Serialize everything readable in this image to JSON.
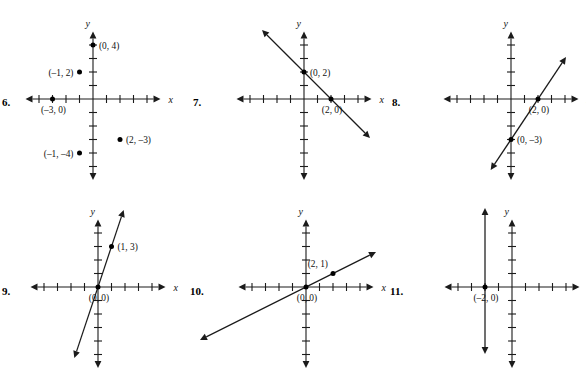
{
  "page": {
    "background": "#ffffff",
    "ink": "#1b1b1b",
    "width": 586,
    "height": 370
  },
  "axis_names": {
    "x": "x",
    "y": "y"
  },
  "chart_data": [
    {
      "id": "problem-6",
      "type": "scatter",
      "number_label": "6.",
      "title": "",
      "xlabel": "x",
      "ylabel": "y",
      "grid": false,
      "legend": "none",
      "xlim": [
        -5,
        5
      ],
      "ylim": [
        -6,
        5
      ],
      "xticks": [
        -4,
        -3,
        -2,
        -1,
        1,
        2,
        3,
        4
      ],
      "yticks": [
        -5,
        -4,
        -3,
        -2,
        -1,
        1,
        2,
        3,
        4
      ],
      "points": [
        {
          "x": 0,
          "y": 4,
          "label": "(0, 4)",
          "label_side": "right"
        },
        {
          "x": -1,
          "y": 2,
          "label": "(-1, 2)",
          "label_side": "left"
        },
        {
          "x": -3,
          "y": 0,
          "label": "(-3, 0)",
          "label_side": "below"
        },
        {
          "x": 2,
          "y": -3,
          "label": "(2, -3)",
          "label_side": "right"
        },
        {
          "x": -1,
          "y": -4,
          "label": "(-1, -4)",
          "label_side": "left"
        }
      ],
      "lines": []
    },
    {
      "id": "problem-7",
      "type": "line",
      "number_label": "7.",
      "title": "",
      "xlabel": "x",
      "ylabel": "y",
      "grid": false,
      "legend": "none",
      "xlim": [
        -5,
        5
      ],
      "ylim": [
        -6,
        5
      ],
      "xticks": [
        -4,
        -3,
        -2,
        -1,
        1,
        2,
        3,
        4
      ],
      "yticks": [
        -5,
        -4,
        -3,
        -2,
        -1,
        1,
        2,
        3,
        4
      ],
      "points": [
        {
          "x": 0,
          "y": 2,
          "label": "(0, 2)",
          "label_side": "right"
        },
        {
          "x": 2,
          "y": 0,
          "label": "(2, 0)",
          "label_side": "below"
        }
      ],
      "lines": [
        {
          "through": [
            [
              0,
              2
            ],
            [
              2,
              0
            ]
          ],
          "slope": -1,
          "intercept": 2,
          "arrows": "both"
        }
      ]
    },
    {
      "id": "problem-8",
      "type": "line",
      "number_label": "8.",
      "title": "",
      "xlabel": "x",
      "ylabel": "y",
      "grid": false,
      "legend": "none",
      "xlim": [
        -5,
        5
      ],
      "ylim": [
        -6,
        5
      ],
      "xticks": [
        -4,
        -3,
        -2,
        -1,
        1,
        2,
        3,
        4
      ],
      "yticks": [
        -5,
        -4,
        -3,
        -2,
        -1,
        1,
        2,
        3,
        4
      ],
      "points": [
        {
          "x": 2,
          "y": 0,
          "label": "(2, 0)",
          "label_side": "below"
        },
        {
          "x": 0,
          "y": -3,
          "label": "(0, -3)",
          "label_side": "right"
        }
      ],
      "lines": [
        {
          "through": [
            [
              0,
              -3
            ],
            [
              2,
              0
            ]
          ],
          "slope": 1.5,
          "intercept": -3,
          "arrows": "both"
        }
      ]
    },
    {
      "id": "problem-9",
      "type": "line",
      "number_label": "9.",
      "title": "",
      "xlabel": "x",
      "ylabel": "y",
      "grid": false,
      "legend": "none",
      "xlim": [
        -5,
        5
      ],
      "ylim": [
        -6,
        5
      ],
      "xticks": [
        -4,
        -3,
        -2,
        -1,
        1,
        2,
        3,
        4
      ],
      "yticks": [
        -5,
        -4,
        -3,
        -2,
        -1,
        1,
        2,
        3,
        4
      ],
      "points": [
        {
          "x": 1,
          "y": 3,
          "label": "(1, 3)",
          "label_side": "right"
        },
        {
          "x": 0,
          "y": 0,
          "label": "(0, 0)",
          "label_side": "below"
        }
      ],
      "lines": [
        {
          "through": [
            [
              0,
              0
            ],
            [
              1,
              3
            ]
          ],
          "slope": 3,
          "intercept": 0,
          "arrows": "both"
        }
      ]
    },
    {
      "id": "problem-10",
      "type": "line",
      "number_label": "10.",
      "title": "",
      "xlabel": "x",
      "ylabel": "y",
      "grid": false,
      "legend": "none",
      "xlim": [
        -5,
        5
      ],
      "ylim": [
        -6,
        5
      ],
      "xticks": [
        -4,
        -3,
        -2,
        -1,
        1,
        2,
        3,
        4
      ],
      "yticks": [
        -5,
        -4,
        -3,
        -2,
        -1,
        1,
        2,
        3,
        4
      ],
      "points": [
        {
          "x": 2,
          "y": 1,
          "label": "(2, 1)",
          "label_side": "above-left"
        },
        {
          "x": 0,
          "y": 0,
          "label": "(0, 0)",
          "label_side": "below"
        }
      ],
      "lines": [
        {
          "through": [
            [
              0,
              0
            ],
            [
              2,
              1
            ]
          ],
          "slope": 0.5,
          "intercept": 0,
          "arrows": "both"
        }
      ]
    },
    {
      "id": "problem-11",
      "type": "line",
      "number_label": "11.",
      "title": "",
      "xlabel": "x",
      "ylabel": "y",
      "grid": false,
      "legend": "none",
      "xlim": [
        -5,
        5
      ],
      "ylim": [
        -6,
        5
      ],
      "xticks": [
        -4,
        -3,
        -2,
        -1,
        1,
        2,
        3,
        4
      ],
      "yticks": [
        -5,
        -4,
        -3,
        -2,
        -1,
        1,
        2,
        3,
        4
      ],
      "points": [
        {
          "x": -2,
          "y": 0,
          "label": "(-2, 0)",
          "label_side": "below"
        }
      ],
      "lines": [
        {
          "vertical_at_x": -2,
          "equation": "x = -2",
          "arrows": "both"
        }
      ]
    }
  ],
  "layout": {
    "panels": [
      {
        "id": "problem-6",
        "left": 0,
        "top": 0,
        "num_x": 2,
        "num_y": 96,
        "origin_x": 93,
        "origin_y": 99
      },
      {
        "id": "problem-7",
        "left": 190,
        "top": 0,
        "num_x": 3,
        "num_y": 96,
        "origin_x": 114,
        "origin_y": 99
      },
      {
        "id": "problem-8",
        "left": 390,
        "top": 0,
        "num_x": 2,
        "num_y": 96,
        "origin_x": 121,
        "origin_y": 99
      },
      {
        "id": "problem-9",
        "left": 0,
        "top": 186,
        "num_x": 2,
        "num_y": 99,
        "origin_x": 98,
        "origin_y": 101
      },
      {
        "id": "problem-10",
        "left": 190,
        "top": 186,
        "num_x": 0,
        "num_y": 99,
        "origin_x": 116,
        "origin_y": 101
      },
      {
        "id": "problem-11",
        "left": 390,
        "top": 186,
        "num_x": 0,
        "num_y": 99,
        "origin_x": 122,
        "origin_y": 101
      }
    ],
    "unit_px": 13.5
  }
}
